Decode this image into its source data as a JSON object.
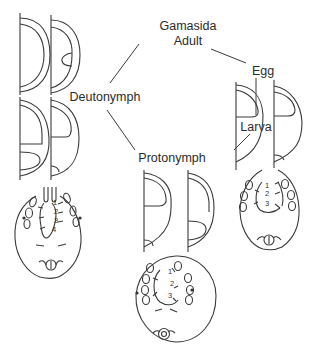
{
  "diagram": {
    "type": "life-cycle",
    "subject": "Gamasida",
    "stages": [
      {
        "id": "adult",
        "label_line1": "Gamasida",
        "label_line2": "Adult"
      },
      {
        "id": "egg",
        "label": "Egg"
      },
      {
        "id": "larva",
        "label": "Larva"
      },
      {
        "id": "protonymph",
        "label": "Protonymph"
      },
      {
        "id": "deutonymph",
        "label": "Deutonymph"
      }
    ],
    "edges": [
      [
        "adult",
        "egg"
      ],
      [
        "egg",
        "larva"
      ],
      [
        "larva",
        "protonymph"
      ],
      [
        "protonymph",
        "deutonymph"
      ],
      [
        "deutonymph",
        "adult"
      ]
    ],
    "specimens": {
      "deutonymph": {
        "numbers": [
          "1",
          "2",
          "3",
          "4"
        ]
      },
      "protonymph": {
        "numbers": [
          "1",
          "2",
          "3"
        ]
      },
      "larva": {
        "numbers": [
          "1",
          "2",
          "3"
        ]
      }
    },
    "colors": {
      "line": "#3a3a3a",
      "text": "#2b2b2b",
      "background": "#ffffff"
    }
  }
}
